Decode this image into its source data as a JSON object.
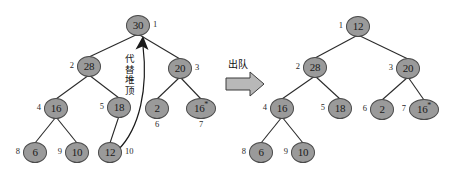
{
  "figure": {
    "operation_label": "出队",
    "replace_label": "代替堆顶",
    "colors": {
      "node_fill": "#9a9a9a",
      "node_stroke": "#4a4a4a",
      "edge": "#2a2a2a",
      "text": "#1a1a1a",
      "background": "#ffffff"
    }
  },
  "trees": [
    {
      "name": "before",
      "nodes": [
        {
          "id": "L1",
          "value": "30",
          "index": "1",
          "x": 138,
          "y": 25,
          "idx_pos": "r",
          "wide": false,
          "star": false
        },
        {
          "id": "L2",
          "value": "28",
          "index": "2",
          "x": 89,
          "y": 66,
          "idx_pos": "l",
          "wide": false,
          "star": false
        },
        {
          "id": "L3",
          "value": "20",
          "index": "3",
          "x": 180,
          "y": 68,
          "idx_pos": "r",
          "wide": false,
          "star": false
        },
        {
          "id": "L4",
          "value": "16",
          "index": "4",
          "x": 56,
          "y": 108,
          "idx_pos": "l",
          "wide": false,
          "star": false
        },
        {
          "id": "L5",
          "value": "18",
          "index": "5",
          "x": 119,
          "y": 107,
          "idx_pos": "l",
          "wide": false,
          "star": false
        },
        {
          "id": "L6",
          "value": "2",
          "index": "6",
          "x": 157,
          "y": 108,
          "idx_pos": "b",
          "wide": false,
          "star": false
        },
        {
          "id": "L7",
          "value": "16",
          "index": "7",
          "x": 201,
          "y": 108,
          "idx_pos": "b",
          "wide": true,
          "star": true
        },
        {
          "id": "L8",
          "value": "6",
          "index": "8",
          "x": 35,
          "y": 152,
          "idx_pos": "l",
          "wide": false,
          "star": false
        },
        {
          "id": "L9",
          "value": "10",
          "index": "9",
          "x": 77,
          "y": 152,
          "idx_pos": "l",
          "wide": false,
          "star": false
        },
        {
          "id": "L10",
          "value": "12",
          "index": "10",
          "x": 110,
          "y": 152,
          "idx_pos": "r",
          "wide": false,
          "star": false
        }
      ],
      "edges": [
        [
          "L1",
          "L2"
        ],
        [
          "L1",
          "L3"
        ],
        [
          "L2",
          "L4"
        ],
        [
          "L2",
          "L5"
        ],
        [
          "L3",
          "L6"
        ],
        [
          "L3",
          "L7"
        ],
        [
          "L4",
          "L8"
        ],
        [
          "L4",
          "L9"
        ],
        [
          "L5",
          "L10"
        ]
      ]
    },
    {
      "name": "after",
      "nodes": [
        {
          "id": "R1",
          "value": "12",
          "index": "1",
          "x": 358,
          "y": 26,
          "idx_pos": "l",
          "wide": false,
          "star": false
        },
        {
          "id": "R2",
          "value": "28",
          "index": "2",
          "x": 315,
          "y": 67,
          "idx_pos": "l",
          "wide": false,
          "star": false
        },
        {
          "id": "R3",
          "value": "20",
          "index": "3",
          "x": 408,
          "y": 68,
          "idx_pos": "l",
          "wide": false,
          "star": false
        },
        {
          "id": "R4",
          "value": "16",
          "index": "4",
          "x": 282,
          "y": 108,
          "idx_pos": "l",
          "wide": false,
          "star": false
        },
        {
          "id": "R5",
          "value": "18",
          "index": "5",
          "x": 340,
          "y": 108,
          "idx_pos": "l",
          "wide": false,
          "star": false
        },
        {
          "id": "R6",
          "value": "2",
          "index": "6",
          "x": 382,
          "y": 109,
          "idx_pos": "l",
          "wide": false,
          "star": false
        },
        {
          "id": "R7",
          "value": "16",
          "index": "7",
          "x": 424,
          "y": 109,
          "idx_pos": "l",
          "wide": true,
          "star": true
        },
        {
          "id": "R8",
          "value": "6",
          "index": "8",
          "x": 261,
          "y": 152,
          "idx_pos": "l",
          "wide": false,
          "star": false
        },
        {
          "id": "R9",
          "value": "10",
          "index": "9",
          "x": 303,
          "y": 152,
          "idx_pos": "l",
          "wide": false,
          "star": false
        }
      ],
      "edges": [
        [
          "R1",
          "R2"
        ],
        [
          "R1",
          "R3"
        ],
        [
          "R2",
          "R4"
        ],
        [
          "R2",
          "R5"
        ],
        [
          "R3",
          "R6"
        ],
        [
          "R3",
          "R7"
        ],
        [
          "R4",
          "R8"
        ],
        [
          "R4",
          "R9"
        ]
      ]
    }
  ],
  "annotations": {
    "replace_arrow": {
      "from": "L10",
      "to": "L1",
      "label": "代替堆顶"
    },
    "dequeue_arrow": {
      "label": "出队"
    }
  }
}
